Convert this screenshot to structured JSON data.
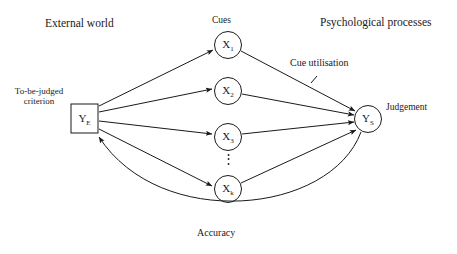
{
  "figure": {
    "background_color": "#ffffff",
    "line_color": "#1a1a1a"
  },
  "headers": {
    "left": "External world",
    "middle": "Cues",
    "right": "Psychological processes"
  },
  "criterion": {
    "label_line1": "To-be-judged",
    "label_line2": "criterion",
    "node_symbol": "Y",
    "node_subscript": "E"
  },
  "judgement": {
    "label": "Judgement",
    "node_symbol": "Y",
    "node_subscript": "S"
  },
  "cues": [
    {
      "symbol": "X",
      "subscript": "1"
    },
    {
      "symbol": "X",
      "subscript": "2"
    },
    {
      "symbol": "X",
      "subscript": "3"
    },
    {
      "symbol": "X",
      "subscript": "k"
    }
  ],
  "ellipsis": "⋮",
  "annotations": {
    "cue_utilisation": "Cue utilisation",
    "accuracy": "Accuracy"
  }
}
